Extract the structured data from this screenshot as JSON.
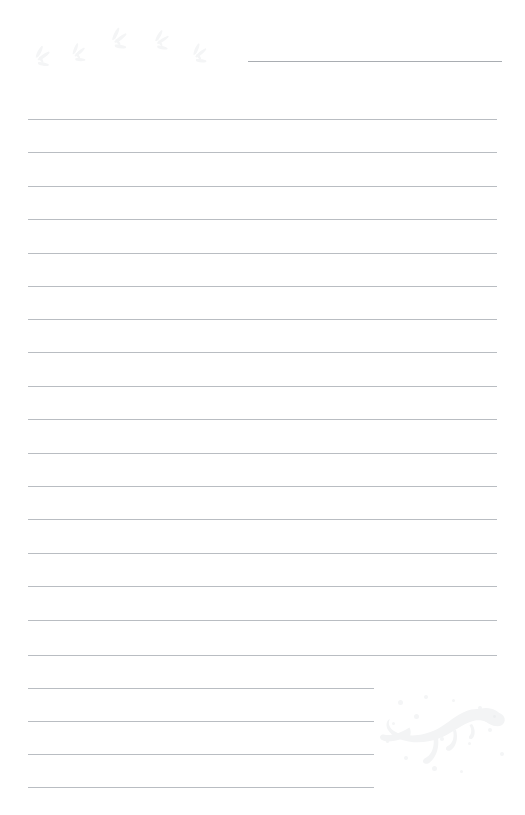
{
  "page": {
    "kind": "lined-writing-paper",
    "theme": "dinosaur",
    "width": 525,
    "height": 815,
    "background_color": "#ffffff",
    "title_label": "",
    "body_text": ""
  },
  "colors": {
    "rule": "#b9bdc2",
    "title_rule": "#a9adb2",
    "artwork": "#f3f4f5",
    "artwork_footprint": "#f5f6f7",
    "speckle": "#f4f5f6",
    "background": "#ffffff"
  },
  "title_rule": {
    "name": "title-write-line",
    "x": 248,
    "y": 61,
    "width": 254,
    "thickness": 1
  },
  "rules": [
    {
      "index": 1,
      "y": 119,
      "x": 28,
      "width": 469,
      "shortened": false
    },
    {
      "index": 2,
      "y": 152,
      "x": 28,
      "width": 469,
      "shortened": false
    },
    {
      "index": 3,
      "y": 186,
      "x": 28,
      "width": 469,
      "shortened": false
    },
    {
      "index": 4,
      "y": 219,
      "x": 28,
      "width": 469,
      "shortened": false
    },
    {
      "index": 5,
      "y": 253,
      "x": 28,
      "width": 469,
      "shortened": false
    },
    {
      "index": 6,
      "y": 286,
      "x": 28,
      "width": 469,
      "shortened": false
    },
    {
      "index": 7,
      "y": 319,
      "x": 28,
      "width": 469,
      "shortened": false
    },
    {
      "index": 8,
      "y": 352,
      "x": 28,
      "width": 469,
      "shortened": false
    },
    {
      "index": 9,
      "y": 386,
      "x": 28,
      "width": 469,
      "shortened": false
    },
    {
      "index": 10,
      "y": 419,
      "x": 28,
      "width": 469,
      "shortened": false
    },
    {
      "index": 11,
      "y": 453,
      "x": 28,
      "width": 469,
      "shortened": false
    },
    {
      "index": 12,
      "y": 486,
      "x": 28,
      "width": 469,
      "shortened": false
    },
    {
      "index": 13,
      "y": 519,
      "x": 28,
      "width": 469,
      "shortened": false
    },
    {
      "index": 14,
      "y": 553,
      "x": 28,
      "width": 469,
      "shortened": false
    },
    {
      "index": 15,
      "y": 586,
      "x": 28,
      "width": 469,
      "shortened": false
    },
    {
      "index": 16,
      "y": 620,
      "x": 28,
      "width": 469,
      "shortened": false
    },
    {
      "index": 17,
      "y": 655,
      "x": 28,
      "width": 469,
      "shortened": false
    },
    {
      "index": 18,
      "y": 688,
      "x": 28,
      "width": 346,
      "shortened": true
    },
    {
      "index": 19,
      "y": 721,
      "x": 28,
      "width": 346,
      "shortened": true
    },
    {
      "index": 20,
      "y": 754,
      "x": 28,
      "width": 346,
      "shortened": true
    },
    {
      "index": 21,
      "y": 787,
      "x": 28,
      "width": 346,
      "shortened": true
    }
  ],
  "artwork": {
    "footprints": {
      "name": "dinosaur-footprint-trail",
      "count": 5,
      "description": "faint three-toed dinosaur footprints trailing across the top-left corner"
    },
    "dinosaur": {
      "name": "tyrannosaurus-silhouette",
      "description": "very faint grey tyrannosaurus rex silhouette in the bottom-right corner"
    },
    "speckles": {
      "name": "speckle-field",
      "count": 14,
      "description": "faint scattered dots around the dinosaur silhouette"
    }
  },
  "line_metrics": {
    "spacing_px": 33.4,
    "thickness_px": 1,
    "left_margin_px": 28,
    "right_margin_px": 28,
    "full_line_count": 17,
    "short_line_count": 4,
    "total_line_count": 21
  }
}
